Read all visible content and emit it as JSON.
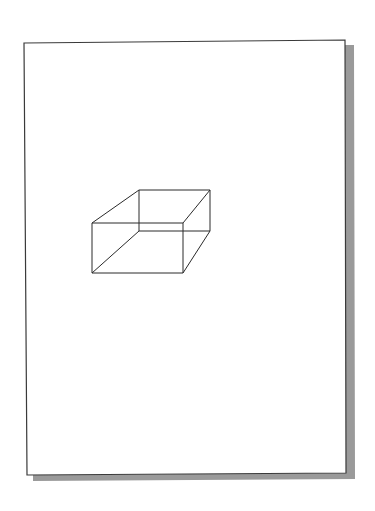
{
  "figure": {
    "colors": {
      "background": "#ffffff",
      "page_fill": "#ffffff",
      "page_border": "#3a3a3a",
      "shadow": "#9a9a9a",
      "box_stroke": "#2a2a2a"
    },
    "page": {
      "corners": [
        [
          24,
          43
        ],
        [
          345,
          40
        ],
        [
          346,
          473
        ],
        [
          27,
          475
        ]
      ]
    },
    "shadow": {
      "corners": [
        [
          345,
          45
        ],
        [
          354,
          45
        ],
        [
          355,
          479
        ],
        [
          33,
          481
        ],
        [
          33,
          475
        ],
        [
          346,
          473
        ]
      ]
    },
    "box": {
      "front_face": [
        [
          92,
          223
        ],
        [
          183,
          223
        ],
        [
          183,
          273
        ],
        [
          92,
          273
        ]
      ],
      "back_face": [
        [
          139,
          190
        ],
        [
          210,
          190
        ],
        [
          210,
          231
        ],
        [
          139,
          231
        ]
      ]
    }
  }
}
